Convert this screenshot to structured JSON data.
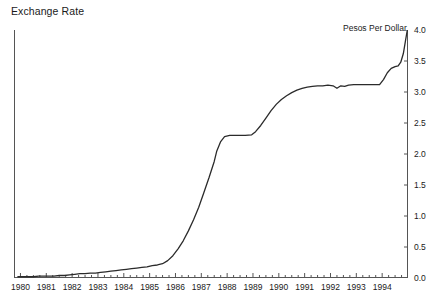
{
  "chart_data": {
    "type": "line",
    "title": "Exchange Rate",
    "unit_label": "Pesos Per Dollar",
    "xlabel": "",
    "ylabel": "",
    "grid": false,
    "legend": "none",
    "xlim": [
      1979.75,
      1995.0
    ],
    "ylim": [
      0.0,
      4.0
    ],
    "ytick_labels": [
      "4.0",
      "3.5",
      "3.0",
      "2.5",
      "2.0",
      "1.5",
      "1.0",
      "0.5",
      "0.0"
    ],
    "ytick_values": [
      4.0,
      3.5,
      3.0,
      2.5,
      2.0,
      1.5,
      1.0,
      0.5,
      0.0
    ],
    "xtick_labels": [
      "1980",
      "1981",
      "1982",
      "1983",
      "1984",
      "1985",
      "1986",
      "1987",
      "1988",
      "1989",
      "1990",
      "1991",
      "1992",
      "1993",
      "1994"
    ],
    "xtick_values": [
      1980,
      1981,
      1982,
      1983,
      1984,
      1985,
      1986,
      1987,
      1988,
      1989,
      1990,
      1991,
      1992,
      1993,
      1994
    ],
    "minor_tick_interval": 0.25,
    "series": [
      {
        "name": "Exchange Rate",
        "color": "#2b2b2b",
        "x": [
          1979.9,
          1980.1,
          1980.3,
          1980.5,
          1980.7,
          1980.9,
          1981.1,
          1981.3,
          1981.5,
          1981.7,
          1981.9,
          1982.1,
          1982.3,
          1982.5,
          1982.7,
          1982.9,
          1983.1,
          1983.3,
          1983.5,
          1983.7,
          1983.9,
          1984.1,
          1984.3,
          1984.5,
          1984.7,
          1984.9,
          1985.1,
          1985.3,
          1985.5,
          1985.7,
          1985.9,
          1986.1,
          1986.3,
          1986.5,
          1986.7,
          1986.9,
          1987.1,
          1987.3,
          1987.5,
          1987.6,
          1987.75,
          1987.9,
          1988.1,
          1988.4,
          1988.7,
          1988.95,
          1989.1,
          1989.3,
          1989.5,
          1989.7,
          1989.9,
          1990.1,
          1990.3,
          1990.5,
          1990.7,
          1990.9,
          1991.1,
          1991.3,
          1991.5,
          1991.7,
          1991.9,
          1992.1,
          1992.25,
          1992.4,
          1992.55,
          1992.7,
          1992.9,
          1993.1,
          1993.3,
          1993.5,
          1993.7,
          1993.9,
          1994.05,
          1994.2,
          1994.35,
          1994.5,
          1994.62,
          1994.72,
          1994.82,
          1994.9,
          1994.97
        ],
        "y": [
          0.02,
          0.02,
          0.02,
          0.02,
          0.03,
          0.03,
          0.03,
          0.03,
          0.04,
          0.04,
          0.05,
          0.06,
          0.07,
          0.07,
          0.08,
          0.08,
          0.09,
          0.1,
          0.11,
          0.12,
          0.13,
          0.14,
          0.15,
          0.16,
          0.17,
          0.18,
          0.2,
          0.21,
          0.23,
          0.28,
          0.36,
          0.47,
          0.6,
          0.76,
          0.94,
          1.14,
          1.38,
          1.62,
          1.88,
          2.05,
          2.2,
          2.28,
          2.3,
          2.3,
          2.3,
          2.31,
          2.36,
          2.46,
          2.58,
          2.7,
          2.8,
          2.88,
          2.94,
          2.99,
          3.03,
          3.06,
          3.08,
          3.09,
          3.1,
          3.1,
          3.11,
          3.1,
          3.06,
          3.1,
          3.09,
          3.11,
          3.12,
          3.12,
          3.12,
          3.12,
          3.12,
          3.12,
          3.2,
          3.31,
          3.38,
          3.41,
          3.42,
          3.48,
          3.62,
          3.82,
          3.99
        ]
      }
    ]
  }
}
